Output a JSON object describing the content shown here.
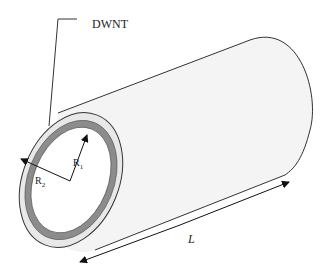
{
  "figure": {
    "type": "schematic",
    "labels": {
      "dwnt": "DWNT",
      "r1": "R",
      "r1_sub": "1",
      "r2": "R",
      "r2_sub": "2",
      "length": "L"
    },
    "colors": {
      "outline": "#333333",
      "body_fill": "#f4f4f4",
      "inner_wall": "#8c8c8c",
      "outer_wall": "#e6e6e6",
      "background": "#ffffff"
    }
  }
}
